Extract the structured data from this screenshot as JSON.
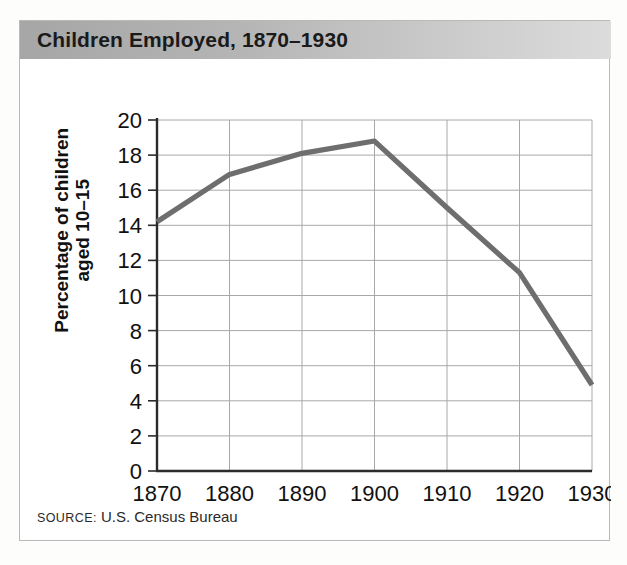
{
  "figure": {
    "title": "Children Employed, 1870–1930",
    "source_label": "Source:",
    "source_text": " U.S. Census Bureau"
  },
  "colors": {
    "line": "#6e6e6e",
    "grid": "#a8a8a8",
    "axis": "#2b2b2b",
    "title_band_left": "#a6a6a6",
    "title_band_right": "#dcdcdc",
    "card_border": "#b9b9b9",
    "text": "#111111"
  },
  "chart_data": {
    "type": "line",
    "title": "Children Employed, 1870–1930",
    "xlabel": "",
    "ylabel": "Percentage of children aged 10–15",
    "ylabel_lines": [
      "Percentage of children",
      "aged 10–15"
    ],
    "x": [
      1870,
      1880,
      1890,
      1900,
      1910,
      1920,
      1930
    ],
    "values": [
      14.2,
      16.9,
      18.1,
      18.8,
      15.0,
      11.3,
      4.9
    ],
    "categories": [
      "1870",
      "1880",
      "1890",
      "1900",
      "1910",
      "1920",
      "1930"
    ],
    "xtick_labels": [
      "1870",
      "1880",
      "1890",
      "1900",
      "1910",
      "1920",
      "1930"
    ],
    "ytick_labels": [
      "0",
      "2",
      "4",
      "6",
      "8",
      "10",
      "12",
      "14",
      "16",
      "18",
      "20"
    ],
    "ytick_values": [
      0,
      2,
      4,
      6,
      8,
      10,
      12,
      14,
      16,
      18,
      20
    ],
    "xlim": [
      1870,
      1930
    ],
    "ylim": [
      0,
      20
    ],
    "grid": true,
    "legend": "none",
    "series": [
      {
        "name": "Percentage of children aged 10–15 employed",
        "values": [
          14.2,
          16.9,
          18.1,
          18.8,
          15.0,
          11.3,
          4.9
        ]
      }
    ],
    "annotations": [
      "Source: U.S. Census Bureau"
    ]
  }
}
